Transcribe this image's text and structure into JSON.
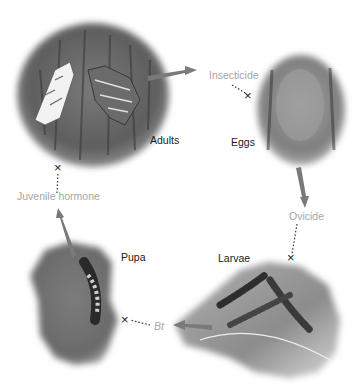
{
  "diagram": {
    "type": "life-cycle",
    "stages": [
      {
        "id": "adults",
        "label": "Adults"
      },
      {
        "id": "eggs",
        "label": "Eggs"
      },
      {
        "id": "larvae",
        "label": "Larvae"
      },
      {
        "id": "pupa",
        "label": "Pupa"
      }
    ],
    "controls": [
      {
        "id": "insecticide",
        "label": "Insecticide",
        "targets": "adults"
      },
      {
        "id": "ovicide",
        "label": "Ovicide",
        "targets": "eggs"
      },
      {
        "id": "bt",
        "label": "Bt",
        "targets": "larvae"
      },
      {
        "id": "juvenile_hormone",
        "label": "Juvenile hormone",
        "targets": "pupa"
      }
    ],
    "block_marker": "×",
    "colors": {
      "arrow": "#7a7a7a",
      "control_text": "#a6a6a6",
      "stage_text": "#1a1a1a",
      "dotted_line": "#333333"
    }
  }
}
